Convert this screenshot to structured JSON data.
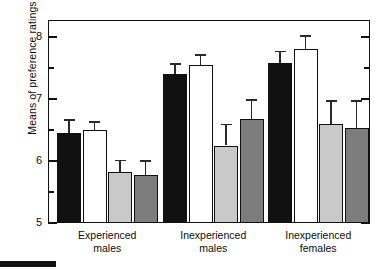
{
  "chart_data": {
    "type": "bar",
    "title": "",
    "xlabel": "",
    "ylabel": "Means of preference ratings",
    "ylim": [
      5,
      8.28
    ],
    "grid": false,
    "legend": "none",
    "y_major_ticks": [
      5,
      6,
      7,
      8
    ],
    "y_minor_ticks": [
      5.5,
      6.5,
      7.5
    ],
    "y_tick_labels": [
      "5",
      "6",
      "7",
      "8"
    ],
    "categories": [
      "Experienced males",
      "Inexperienced males",
      "Inexperienced females"
    ],
    "category_lines": [
      [
        "Experienced",
        "males"
      ],
      [
        "Inexperienced",
        "males"
      ],
      [
        "Inexperienced",
        "females"
      ]
    ],
    "series": [
      {
        "name": "bar-1",
        "color": "#111111",
        "values": [
          6.45,
          7.4,
          7.58
        ],
        "errors_upper": [
          0.22,
          0.18,
          0.2
        ]
      },
      {
        "name": "bar-2",
        "color": "#ffffff",
        "values": [
          6.5,
          7.55,
          7.8
        ],
        "errors_upper": [
          0.14,
          0.17,
          0.23
        ]
      },
      {
        "name": "bar-3",
        "color": "#c9c9c9",
        "values": [
          5.82,
          6.25,
          6.6
        ],
        "errors_upper": [
          0.2,
          0.35,
          0.38
        ]
      },
      {
        "name": "bar-4",
        "color": "#7d7d7d",
        "values": [
          5.77,
          6.67,
          6.53
        ],
        "errors_upper": [
          0.24,
          0.33,
          0.45
        ]
      }
    ]
  },
  "axis": {
    "y_label_text": "Means of preference ratings"
  },
  "colors": {
    "bar_black": "#111111",
    "bar_white": "#ffffff",
    "bar_light_gray": "#c9c9c9",
    "bar_dark_gray": "#7d7d7d",
    "frame": "#111111",
    "text": "#0d0d0d"
  }
}
